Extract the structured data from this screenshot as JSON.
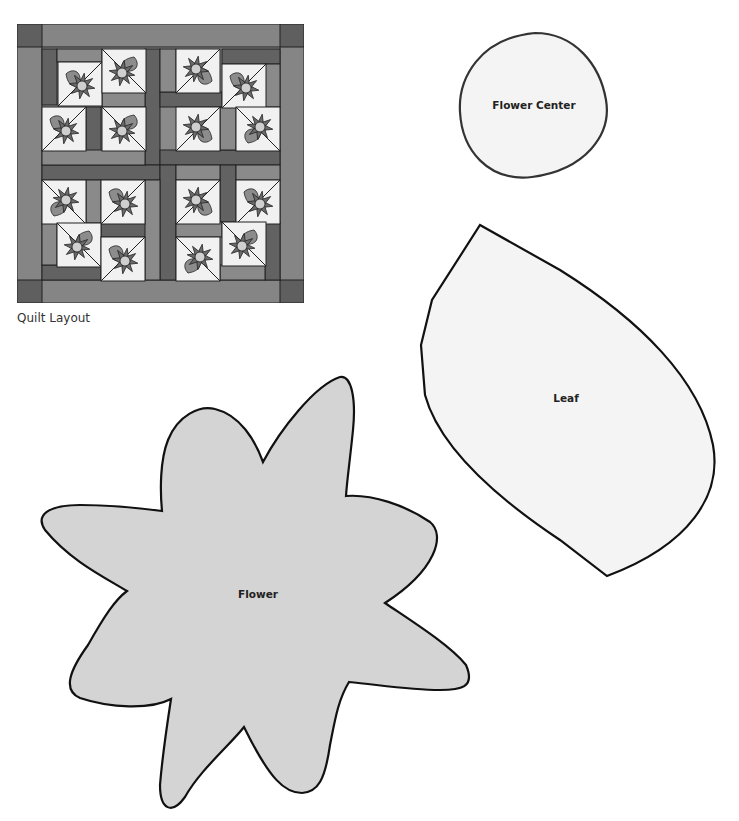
{
  "quilt": {
    "caption": "Quilt Layout",
    "colors": {
      "border": "#858585",
      "corner": "#5f5f5f",
      "dark_strip": "#626262",
      "medium_strip": "#8a8a8a",
      "block_bg": "#f1f1f1",
      "petal": "#6a6a6a",
      "leaf": "#8c8c8c",
      "center": "#cfcfcf",
      "outline": "#222222"
    },
    "blocks": [
      {
        "x": 58,
        "y": 62,
        "rot": 0
      },
      {
        "x": 102,
        "y": 49,
        "rot": 90
      },
      {
        "x": 42,
        "y": 107,
        "rot": 0
      },
      {
        "x": 102,
        "y": 107,
        "rot": 90
      },
      {
        "x": 176,
        "y": 49,
        "rot": 180
      },
      {
        "x": 222,
        "y": 64,
        "rot": 0
      },
      {
        "x": 176,
        "y": 107,
        "rot": 180
      },
      {
        "x": 236,
        "y": 107,
        "rot": 270
      },
      {
        "x": 42,
        "y": 180,
        "rot": 270
      },
      {
        "x": 101,
        "y": 180,
        "rot": 0
      },
      {
        "x": 57,
        "y": 223,
        "rot": 90
      },
      {
        "x": 101,
        "y": 237,
        "rot": 0
      },
      {
        "x": 176,
        "y": 180,
        "rot": 180
      },
      {
        "x": 236,
        "y": 180,
        "rot": 0
      },
      {
        "x": 176,
        "y": 237,
        "rot": 270
      },
      {
        "x": 222,
        "y": 222,
        "rot": 90
      }
    ]
  },
  "templates": {
    "flower_center": {
      "label": "Flower Center"
    },
    "leaf": {
      "label": "Leaf"
    },
    "flower": {
      "label": "Flower"
    },
    "fill_white": "#f4f4f4",
    "fill_gray": "#d4d4d4",
    "stroke": "#1a1a1a"
  }
}
